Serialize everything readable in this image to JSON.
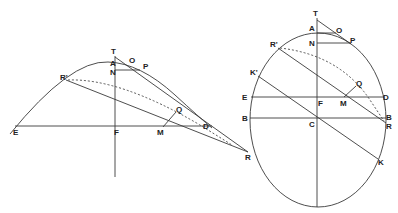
{
  "figures": [
    {
      "name": "parabola-figure",
      "labels": {
        "T": "T",
        "A": "A",
        "N": "N",
        "O": "O",
        "P": "P",
        "R_prime": "R'",
        "Q": "Q",
        "E": "E",
        "F": "F",
        "M": "M",
        "D": "D",
        "R": "R"
      }
    },
    {
      "name": "ellipse-figure",
      "labels": {
        "T": "T",
        "A": "A",
        "O": "O",
        "P": "P",
        "N": "N",
        "R_prime": "R'",
        "K_prime": "K'",
        "Q": "Q",
        "E": "E",
        "F": "F",
        "M": "M",
        "D": "D",
        "B_left": "B",
        "C": "C",
        "B_right": "B",
        "R": "R",
        "K": "K"
      }
    }
  ],
  "colors": {
    "line": "#3a3a3a",
    "text": "#222222",
    "background": "#ffffff"
  }
}
